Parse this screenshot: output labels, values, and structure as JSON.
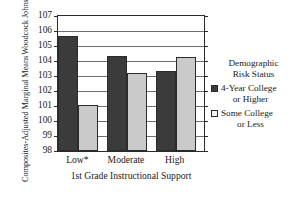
{
  "chart_data": {
    "type": "bar",
    "title": "",
    "xlabel": "1st Grade Instructional Support",
    "ylabel_lines": [
      "Woodcock Johnson 1st Grade",
      "Composites-Adjusted Marginal Means"
    ],
    "categories": [
      "Low*",
      "Moderate",
      "High"
    ],
    "series": [
      {
        "name": "4-Year College or Higher",
        "values": [
          105.65,
          104.35,
          103.35
        ],
        "color": "#3b3b3b"
      },
      {
        "name": "Some College or Less",
        "values": [
          101.05,
          103.2,
          104.3
        ],
        "color": "#cacaca"
      }
    ],
    "ylim": [
      98,
      107
    ],
    "yticks": [
      98,
      99,
      100,
      101,
      102,
      103,
      104,
      105,
      106,
      107
    ],
    "ytick_labels": [
      "98",
      "99",
      "100",
      "101",
      "102",
      "103",
      "104",
      "105",
      "106",
      "107"
    ],
    "grid": true,
    "legend_position": "right"
  },
  "legend": {
    "title_lines": [
      "Demographic",
      "Risk Status"
    ],
    "entries": [
      {
        "line1": "4-Year College",
        "line2": "or Higher",
        "swatch": "dark-swatch-icon"
      },
      {
        "line1": "Some College",
        "line2": "or Less",
        "swatch": "light-swatch-icon"
      }
    ]
  }
}
